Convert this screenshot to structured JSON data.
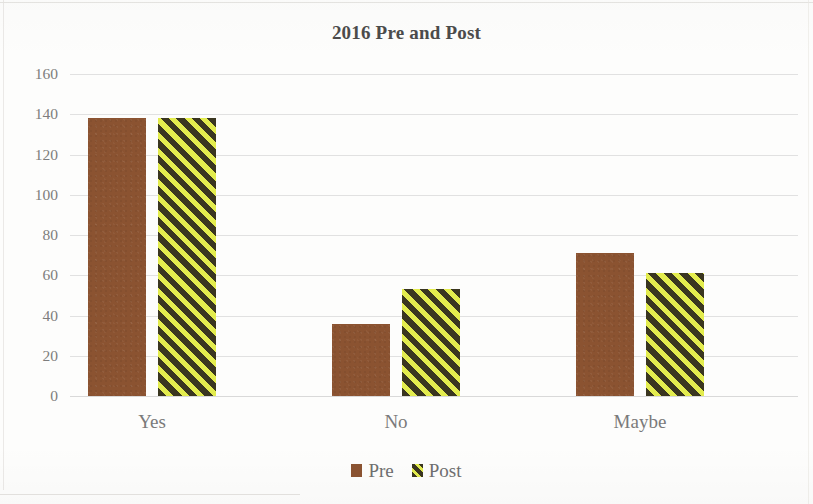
{
  "chart_data": {
    "type": "bar",
    "title": "2016 Pre and Post",
    "xlabel": "",
    "ylabel": "",
    "categories": [
      "Yes",
      "No",
      "Maybe"
    ],
    "series": [
      {
        "name": "Pre",
        "values": [
          138,
          36,
          71
        ],
        "color": "#8B5331",
        "fill": "solid"
      },
      {
        "name": "Post",
        "values": [
          138,
          53,
          61
        ],
        "color": "#E3EC4E",
        "fill": "diagonal-stripes-yellow-black"
      }
    ],
    "ylim": [
      0,
      160
    ],
    "ytick_step": 20,
    "yticks": [
      0,
      20,
      40,
      60,
      80,
      100,
      120,
      140,
      160
    ],
    "ytick_labels": [
      "0",
      "20",
      "40",
      "60",
      "80",
      "100",
      "120",
      "140",
      "160"
    ],
    "grid": true,
    "grid_axis": "y",
    "legend": true,
    "legend_position": "bottom",
    "legend_entries": [
      "Pre",
      "Post"
    ]
  },
  "colors": {
    "pre_brown": "#8B5331",
    "post_yellow": "#E3EC4E",
    "post_dark": "#33301C",
    "gridline": "#DCDCDC",
    "axis_text": "#7D7D7D",
    "title_text": "#4B4B4B",
    "background": "#FDFDFC"
  }
}
